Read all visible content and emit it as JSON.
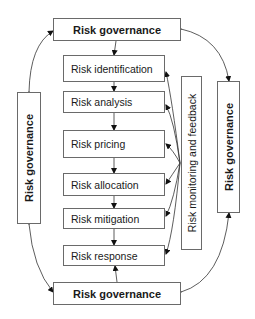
{
  "diagram": {
    "top_governance": "Risk governance",
    "bottom_governance": "Risk governance",
    "left_governance": "Risk governance",
    "right_governance": "Risk governance",
    "monitoring": "Risk monitoring and feedback",
    "steps": [
      "Risk identification",
      "Risk analysis",
      "Risk pricing",
      "Risk allocation",
      "Risk mitigation",
      "Risk response"
    ]
  },
  "colors": {
    "border": "#6a6a6a",
    "line": "#333333",
    "text": "#1a1a1a"
  }
}
